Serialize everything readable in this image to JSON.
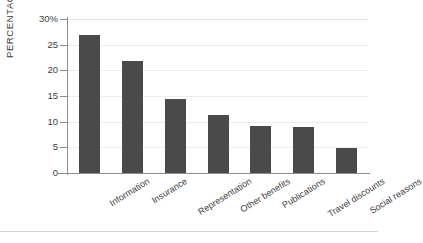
{
  "chart_data": {
    "type": "bar",
    "title": "",
    "xlabel": "",
    "ylabel": "PERCENTAGE",
    "categories": [
      "Information",
      "Insurance",
      "Representation",
      "Other benefits",
      "Publications",
      "Travel discounts",
      "Social reasons"
    ],
    "values": [
      26.9,
      21.8,
      14.4,
      11.3,
      9.2,
      9.0,
      4.8
    ],
    "ylim": [
      0,
      30
    ],
    "yticks": [
      0,
      5,
      10,
      15,
      20,
      25,
      30
    ],
    "ytick_labels": [
      "0",
      "5",
      "10",
      "15",
      "20",
      "25",
      "30%"
    ],
    "grid": true,
    "legend": "none",
    "bar_color": "#4a4a4a",
    "gridline_color": "#ededed",
    "axis_color": "#8d8d8d"
  }
}
